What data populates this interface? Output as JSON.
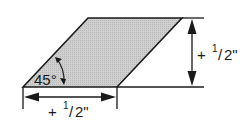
{
  "diagram": {
    "shape": "parallelogram",
    "fill_color": "#c8c8c8",
    "stroke_color": "#1a1a1a",
    "angle_label": "45°",
    "horizontal_dimension": {
      "sign": "+",
      "numerator": "1",
      "denominator": "2\""
    },
    "vertical_dimension": {
      "sign": "+",
      "numerator": "1",
      "denominator": "2\""
    }
  }
}
